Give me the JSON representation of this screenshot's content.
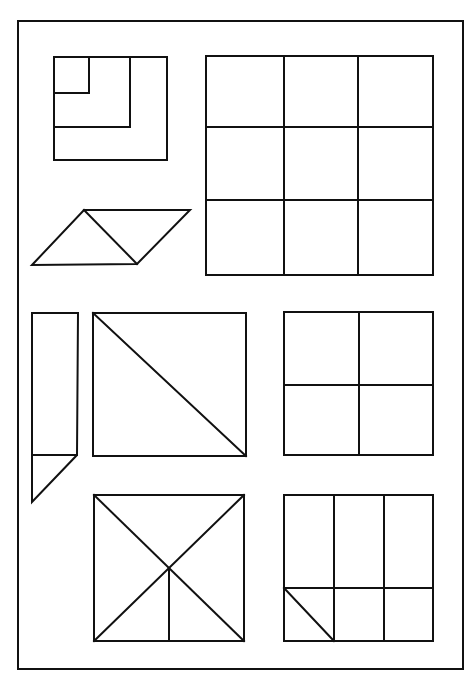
{
  "figure": {
    "stroke_color": "#111111",
    "background_color": "#ffffff",
    "border": {
      "x1": 18,
      "y1": 21,
      "x2": 463,
      "y2": 669
    },
    "shapes": [
      {
        "name": "nested-squares",
        "outer": [
          54,
          57,
          167,
          160
        ],
        "inner_corners": [
          [
            89,
            93
          ],
          [
            130,
            127
          ]
        ]
      },
      {
        "name": "parallelogram-split",
        "points": [
          [
            32,
            265
          ],
          [
            84,
            210
          ],
          [
            190,
            210
          ],
          [
            137,
            264
          ]
        ],
        "diagonal": [
          [
            84,
            210
          ],
          [
            137,
            264
          ]
        ]
      },
      {
        "name": "grid-3x3",
        "rect": [
          206,
          56,
          433,
          275
        ],
        "v_lines": [
          284,
          358
        ],
        "h_lines": [
          127,
          200
        ]
      },
      {
        "name": "tall-rect-with-triangle",
        "rect": [
          32,
          313,
          78,
          455
        ],
        "triangle": [
          [
            32,
            455
          ],
          [
            76,
            455
          ],
          [
            32,
            502
          ]
        ]
      },
      {
        "name": "square-one-diagonal",
        "rect": [
          93,
          313,
          246,
          456
        ]
      },
      {
        "name": "grid-2x2",
        "rect": [
          284,
          312,
          433,
          455
        ],
        "v_line": 359,
        "h_line": 385
      },
      {
        "name": "square-x-with-stem",
        "rect": [
          94,
          495,
          244,
          641
        ],
        "center": [
          169,
          568
        ]
      },
      {
        "name": "three-column-split",
        "rect": [
          284,
          495,
          433,
          641
        ],
        "v_lines": [
          334,
          384
        ],
        "h_line": 588,
        "diagonal": [
          [
            284,
            588
          ],
          [
            334,
            641
          ]
        ]
      }
    ]
  }
}
